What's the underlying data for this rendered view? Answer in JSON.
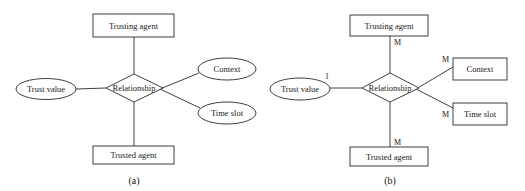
{
  "diagrams": {
    "a": {
      "caption": "(a)",
      "relationship": "Relationship",
      "trusting_agent": "Trusting agent",
      "trusted_agent": "Trusted agent",
      "trust_value": "Trust value",
      "context": "Context",
      "time_slot": "Time slot"
    },
    "b": {
      "caption": "(b)",
      "relationship": "Relationship",
      "trusting_agent": "Trusting agent",
      "trusted_agent": "Trusted agent",
      "trust_value": "Trust value",
      "context": "Context",
      "time_slot": "Time slot",
      "cardinality": {
        "trusting_agent": "M",
        "trusted_agent": "M",
        "trust_value": "1",
        "context": "M",
        "time_slot": "M"
      }
    }
  }
}
